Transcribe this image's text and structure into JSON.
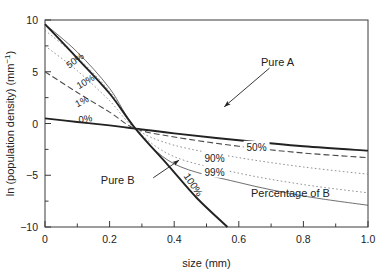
{
  "chart_data": {
    "type": "line",
    "title": "",
    "xlabel": "size (mm)",
    "ylabel": "ln (population density) (mm−1)",
    "ylabel_parts": {
      "main": "ln (population density) (mm",
      "sup": "−1",
      "tail": ")"
    },
    "xlim": [
      0,
      1.0
    ],
    "ylim": [
      -10,
      10
    ],
    "xticks": [
      0,
      0.2,
      0.4,
      0.6,
      0.8,
      1.0
    ],
    "xticklabels": [
      "0",
      "0.2",
      "0.4",
      "0.6",
      "0.8",
      "1.0"
    ],
    "xminorticks": [
      0.1,
      0.3,
      0.5,
      0.7,
      0.9
    ],
    "yticks": [
      -10,
      -5,
      0,
      5,
      10
    ],
    "yticklabels": [
      "−10",
      "−5",
      "0",
      "5",
      "10"
    ],
    "yminorticks": [
      -7.5,
      -2.5,
      2.5,
      7.5
    ],
    "grid": false,
    "legend": "none",
    "convergence_point": {
      "x": 0.28,
      "y": -0.5
    },
    "series": [
      {
        "name": "Pure A",
        "percent_B": 0,
        "style": "solid-thick",
        "points": [
          [
            0.0,
            0.5
          ],
          [
            0.1,
            0.15
          ],
          [
            0.2,
            -0.18
          ],
          [
            0.28,
            -0.5
          ],
          [
            0.4,
            -0.95
          ],
          [
            0.6,
            -1.62
          ],
          [
            0.8,
            -2.2
          ],
          [
            1.0,
            -2.62
          ]
        ]
      },
      {
        "name": "50%",
        "percent_B": 50,
        "style": "dashed",
        "points": [
          [
            0.0,
            5.0
          ],
          [
            0.1,
            3.0
          ],
          [
            0.2,
            1.1
          ],
          [
            0.28,
            -0.5
          ],
          [
            0.4,
            -1.3
          ],
          [
            0.6,
            -2.2
          ],
          [
            0.8,
            -2.85
          ],
          [
            1.0,
            -3.3
          ]
        ]
      },
      {
        "name": "90%",
        "percent_B": 90,
        "style": "dotted",
        "points": [
          [
            0.0,
            7.5
          ],
          [
            0.1,
            5.1
          ],
          [
            0.2,
            2.2
          ],
          [
            0.28,
            -0.5
          ],
          [
            0.4,
            -2.1
          ],
          [
            0.6,
            -3.3
          ],
          [
            0.8,
            -4.2
          ],
          [
            1.0,
            -4.9
          ]
        ]
      },
      {
        "name": "99%",
        "percent_B": 99,
        "style": "dotted",
        "points": [
          [
            0.0,
            9.0
          ],
          [
            0.1,
            6.4
          ],
          [
            0.2,
            3.1
          ],
          [
            0.28,
            -0.5
          ],
          [
            0.4,
            -3.2
          ],
          [
            0.6,
            -4.8
          ],
          [
            0.8,
            -5.9
          ],
          [
            1.0,
            -6.7
          ]
        ]
      },
      {
        "name": "99.9%",
        "percent_B": 99.9,
        "style": "solid-thin",
        "points": [
          [
            0.0,
            9.6
          ],
          [
            0.1,
            6.9
          ],
          [
            0.2,
            3.4
          ],
          [
            0.28,
            -0.5
          ],
          [
            0.4,
            -3.9
          ],
          [
            0.6,
            -5.7
          ],
          [
            0.8,
            -7.0
          ],
          [
            1.0,
            -7.9
          ]
        ]
      },
      {
        "name": "Pure B",
        "percent_B": 100,
        "style": "solid-thick",
        "points": [
          [
            0.0,
            9.6
          ],
          [
            0.1,
            6.3
          ],
          [
            0.2,
            2.9
          ],
          [
            0.28,
            -0.5
          ],
          [
            0.38,
            -4.0
          ],
          [
            0.47,
            -7.2
          ],
          [
            0.565,
            -10.0
          ]
        ]
      }
    ],
    "curve_labels_left": [
      {
        "text": "50%",
        "x": 0.075,
        "y": 5.3
      },
      {
        "text": "10%",
        "x": 0.105,
        "y": 3.3
      },
      {
        "text": "1%",
        "x": 0.1,
        "y": 1.55
      },
      {
        "text": "0%",
        "x": 0.105,
        "y": 0.05
      }
    ],
    "curve_labels_right": [
      {
        "text": "50%",
        "x": 0.655,
        "y": -2.35
      },
      {
        "text": "90%",
        "x": 0.525,
        "y": -3.35
      },
      {
        "text": "99%",
        "x": 0.525,
        "y": -4.75
      }
    ],
    "curve_label_rotated": {
      "text": "100%",
      "x": 0.45,
      "y": -6.1
    },
    "annotations": [
      {
        "text": "Pure A",
        "label_x": 0.72,
        "label_y": 5.9,
        "arrow_from": [
          0.695,
          5.35
        ],
        "arrow_to": [
          0.555,
          1.62
        ]
      },
      {
        "text": "Pure B",
        "label_x": 0.225,
        "label_y": -5.45,
        "arrow_from": [
          0.335,
          -5.25
        ],
        "arrow_to": [
          0.415,
          -3.55
        ]
      },
      {
        "text": "Percentage of B",
        "label_x": 0.76,
        "label_y": -6.75
      }
    ]
  },
  "colors": {
    "axis": "#3a3a3a",
    "text": "#1a1a1a",
    "curve_dark": "#222222",
    "curve_mid": "#4a4a4a",
    "curve_light": "#777777"
  }
}
